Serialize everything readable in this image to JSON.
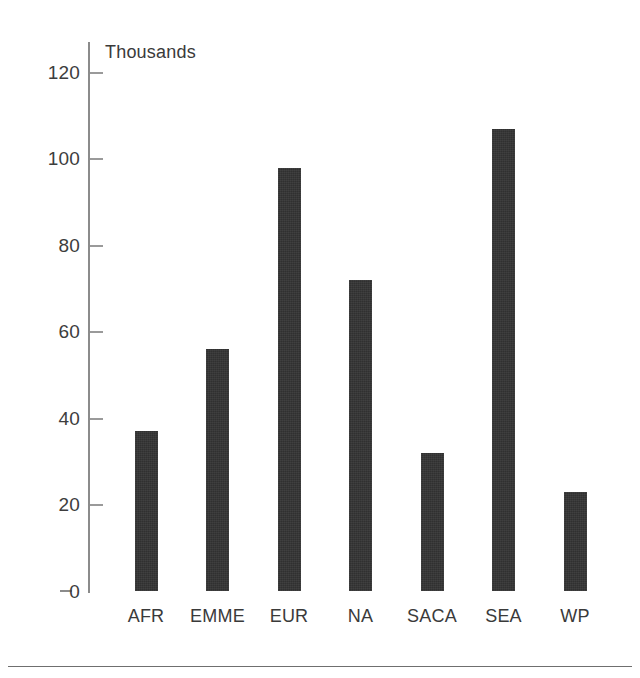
{
  "chart_data": {
    "type": "bar",
    "title": "",
    "subtitle": "",
    "unit_label": "Thousands",
    "xlabel": "",
    "ylabel": "",
    "categories": [
      "AFR",
      "EMME",
      "EUR",
      "NA",
      "SACA",
      "SEA",
      "WP"
    ],
    "values": [
      37,
      56,
      98,
      72,
      32,
      107,
      23
    ],
    "ylim": [
      0,
      120
    ],
    "ytick_labels": [
      "0",
      "20",
      "40",
      "60",
      "80",
      "100",
      "120"
    ],
    "ytick_values": [
      0,
      20,
      40,
      60,
      80,
      100,
      120
    ],
    "grid": false,
    "legend": null,
    "legend_position": "none",
    "series": [
      {
        "name": "",
        "values": [
          37,
          56,
          98,
          72,
          32,
          107,
          23
        ]
      }
    ],
    "colors": {
      "bar": "#303030",
      "axis": "#8b8b8b",
      "tick_text": "#3d3d3d",
      "background": "#ffffff",
      "rule": "#6f6f6f"
    }
  }
}
